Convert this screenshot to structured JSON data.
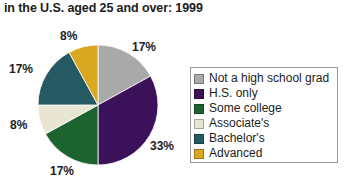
{
  "chart_data": {
    "type": "pie",
    "title": "in the U.S. aged 25 and over: 1999",
    "xlabel": "",
    "ylabel": "",
    "legend_position": "right",
    "grid": false,
    "categories": [
      "Not a high school grad",
      "H.S. only",
      "Some college",
      "Associate's",
      "Bachelor's",
      "Advanced"
    ],
    "values": [
      17,
      33,
      17,
      8,
      17,
      8
    ],
    "value_labels": [
      "17%",
      "33%",
      "17%",
      "8%",
      "17%",
      "8%"
    ],
    "colors": [
      "#a9a9a9",
      "#3b1159",
      "#1d6330",
      "#e8e5d2",
      "#255a63",
      "#d9a81f"
    ],
    "slices": [
      {
        "label": "Not a high school grad",
        "value": 17,
        "display": "17%",
        "color": "#a9a9a9"
      },
      {
        "label": "H.S. only",
        "value": 33,
        "display": "33%",
        "color": "#3b1159"
      },
      {
        "label": "Some college",
        "value": 17,
        "display": "17%",
        "color": "#1d6330"
      },
      {
        "label": "Associate's",
        "value": 8,
        "display": "8%",
        "color": "#e8e5d2"
      },
      {
        "label": "Bachelor's",
        "value": 17,
        "display": "17%",
        "color": "#255a63"
      },
      {
        "label": "Advanced",
        "value": 8,
        "display": "8%",
        "color": "#d9a81f"
      }
    ]
  },
  "title": "in the U.S. aged 25 and over: 1999",
  "labels": {
    "top_right": "17%",
    "right": "33%",
    "bottom": "17%",
    "left_lower": "8%",
    "left_upper": "17%",
    "top": "8%"
  },
  "legend": {
    "items": [
      {
        "label": "Not a high school grad",
        "color": "#a9a9a9"
      },
      {
        "label": "H.S. only",
        "color": "#3b1159"
      },
      {
        "label": "Some college",
        "color": "#1d6330"
      },
      {
        "label": "Associate's",
        "color": "#e8e5d2"
      },
      {
        "label": "Bachelor's",
        "color": "#255a63"
      },
      {
        "label": "Advanced",
        "color": "#d9a81f"
      }
    ]
  }
}
